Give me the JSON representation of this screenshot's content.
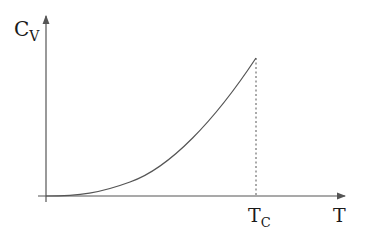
{
  "diagram": {
    "y_axis": {
      "label_main": "C",
      "label_sub": "V"
    },
    "x_axis": {
      "label": "T"
    },
    "marker": {
      "label_main": "T",
      "label_sub": "C",
      "style": "dashed"
    },
    "curve": {
      "shape": "convex increasing from origin to T_C, then drops to zero"
    },
    "colors": {
      "axis": "#555555",
      "curve": "#555555",
      "text": "#1a1a1a"
    }
  }
}
